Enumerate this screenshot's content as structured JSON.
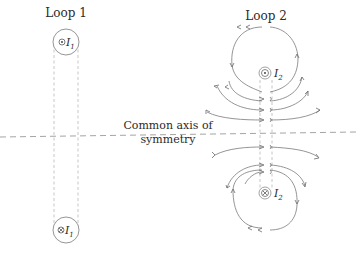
{
  "diagram": {
    "loop1": {
      "title": "Loop 1",
      "top_conductor": {
        "symbol": "dot",
        "label": "I",
        "sub": "1"
      },
      "bottom_conductor": {
        "symbol": "cross",
        "label": "I",
        "sub": "1"
      }
    },
    "loop2": {
      "title": "Loop 2",
      "top_conductor": {
        "symbol": "dot",
        "label": "I",
        "sub": "2"
      },
      "bottom_conductor": {
        "symbol": "cross",
        "label": "I",
        "sub": "2"
      }
    },
    "axis_label": {
      "line1": "Common axis of",
      "line2": "symmetry"
    },
    "colors": {
      "stroke": "#7a7a7a",
      "text": "#2a2a2a",
      "dashed": "#b8b8b8"
    }
  }
}
